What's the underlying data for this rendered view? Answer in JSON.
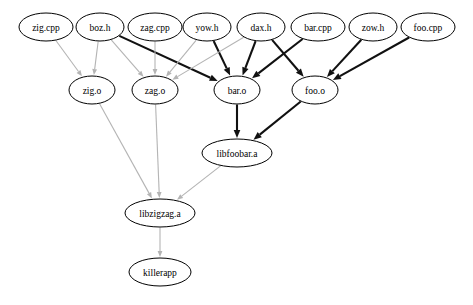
{
  "diagram": {
    "background_color": "#ffffff",
    "edge_colors": {
      "weak": "#b4b4b4",
      "strong": "#111111"
    },
    "node_style": {
      "shape": "ellipse",
      "fill": "#ffffff",
      "stroke": "#000000"
    }
  },
  "nodes": [
    {
      "id": "zig_cpp",
      "label": "zig.cpp",
      "cx": 46,
      "cy": 27,
      "rx": 27,
      "ry": 14
    },
    {
      "id": "boz_h",
      "label": "boz.h",
      "cx": 100,
      "cy": 27,
      "rx": 24,
      "ry": 14
    },
    {
      "id": "zag_cpp",
      "label": "zag.cpp",
      "cx": 155,
      "cy": 27,
      "rx": 27,
      "ry": 14
    },
    {
      "id": "yow_h",
      "label": "yow.h",
      "cx": 207,
      "cy": 27,
      "rx": 24,
      "ry": 14
    },
    {
      "id": "dax_h",
      "label": "dax.h",
      "cx": 261,
      "cy": 27,
      "rx": 24,
      "ry": 14
    },
    {
      "id": "bar_cpp",
      "label": "bar.cpp",
      "cx": 318,
      "cy": 27,
      "rx": 27,
      "ry": 14
    },
    {
      "id": "zow_h",
      "label": "zow.h",
      "cx": 373,
      "cy": 27,
      "rx": 24,
      "ry": 14
    },
    {
      "id": "foo_cpp",
      "label": "foo.cpp",
      "cx": 428,
      "cy": 27,
      "rx": 27,
      "ry": 14
    },
    {
      "id": "zig_o",
      "label": "zig.o",
      "cx": 92,
      "cy": 90,
      "rx": 23,
      "ry": 14
    },
    {
      "id": "zag_o",
      "label": "zag.o",
      "cx": 155,
      "cy": 90,
      "rx": 23,
      "ry": 14
    },
    {
      "id": "bar_o",
      "label": "bar.o",
      "cx": 237,
      "cy": 90,
      "rx": 23,
      "ry": 14
    },
    {
      "id": "foo_o",
      "label": "foo.o",
      "cx": 315,
      "cy": 90,
      "rx": 23,
      "ry": 14
    },
    {
      "id": "libfoobar",
      "label": "libfoobar.a",
      "cx": 237,
      "cy": 153,
      "rx": 35,
      "ry": 14
    },
    {
      "id": "libzigzag",
      "label": "libzigzag.a",
      "cx": 160,
      "cy": 213,
      "rx": 35,
      "ry": 14
    },
    {
      "id": "killerapp",
      "label": "killerapp",
      "cx": 160,
      "cy": 272,
      "rx": 31,
      "ry": 14
    }
  ],
  "edges": [
    {
      "from": "zig_cpp",
      "to": "zig_o",
      "weight": "weak"
    },
    {
      "from": "boz_h",
      "to": "zig_o",
      "weight": "weak"
    },
    {
      "from": "boz_h",
      "to": "zag_o",
      "weight": "weak"
    },
    {
      "from": "boz_h",
      "to": "bar_o",
      "weight": "strong"
    },
    {
      "from": "zag_cpp",
      "to": "zag_o",
      "weight": "weak"
    },
    {
      "from": "yow_h",
      "to": "zag_o",
      "weight": "weak"
    },
    {
      "from": "yow_h",
      "to": "bar_o",
      "weight": "strong"
    },
    {
      "from": "dax_h",
      "to": "zag_o",
      "weight": "weak"
    },
    {
      "from": "dax_h",
      "to": "bar_o",
      "weight": "strong"
    },
    {
      "from": "dax_h",
      "to": "foo_o",
      "weight": "strong"
    },
    {
      "from": "bar_cpp",
      "to": "bar_o",
      "weight": "strong"
    },
    {
      "from": "zow_h",
      "to": "foo_o",
      "weight": "strong"
    },
    {
      "from": "foo_cpp",
      "to": "foo_o",
      "weight": "strong"
    },
    {
      "from": "bar_o",
      "to": "libfoobar",
      "weight": "strong"
    },
    {
      "from": "foo_o",
      "to": "libfoobar",
      "weight": "strong"
    },
    {
      "from": "zig_o",
      "to": "libzigzag",
      "weight": "weak"
    },
    {
      "from": "zag_o",
      "to": "libzigzag",
      "weight": "weak"
    },
    {
      "from": "libfoobar",
      "to": "libzigzag",
      "weight": "weak"
    },
    {
      "from": "libzigzag",
      "to": "killerapp",
      "weight": "weak"
    }
  ]
}
